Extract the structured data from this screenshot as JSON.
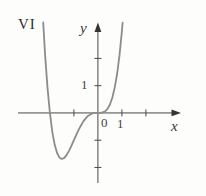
{
  "panel_label": "VI",
  "axes": {
    "x_axis_label": "x",
    "y_axis_label": "y",
    "origin_label": "0",
    "x_tick_label": "1",
    "y_tick_label": "1",
    "x_ticks": [
      -1,
      1,
      2
    ],
    "y_ticks": [
      -2,
      -1,
      1,
      2
    ],
    "x_range": [
      -3.33,
      3.42
    ],
    "y_range": [
      -2.57,
      3.3
    ]
  },
  "colors": {
    "background": "#fdfdfc",
    "axis": "#4a4a4a",
    "arrow": "#333333",
    "curve": "#8c8c8c",
    "text": "#3a3a3a"
  },
  "chart_data": {
    "type": "line",
    "title": "",
    "xlabel": "x",
    "ylabel": "y",
    "xlim": [
      -3.33,
      3.42
    ],
    "ylim": [
      -2.57,
      3.3
    ],
    "grid": false,
    "legend": null,
    "curve": {
      "description": "quartic-shaped curve, zero and flat tangent at origin",
      "equation_fit": "y = x^4 + 2x^3",
      "x_domain": [
        -2.28,
        1.03
      ],
      "x_intercepts": [
        -2,
        0
      ],
      "local_min": {
        "x": -1.5,
        "y": -1.69
      },
      "points": [
        [
          -2.28,
          3.32
        ],
        [
          -2.2,
          2.13
        ],
        [
          -2.1,
          0.93
        ],
        [
          -2.0,
          0.0
        ],
        [
          -1.9,
          -0.69
        ],
        [
          -1.8,
          -1.17
        ],
        [
          -1.7,
          -1.47
        ],
        [
          -1.6,
          -1.64
        ],
        [
          -1.5,
          -1.69
        ],
        [
          -1.4,
          -1.65
        ],
        [
          -1.3,
          -1.54
        ],
        [
          -1.2,
          -1.38
        ],
        [
          -1.1,
          -1.2
        ],
        [
          -1.0,
          -1.0
        ],
        [
          -0.9,
          -0.8
        ],
        [
          -0.8,
          -0.61
        ],
        [
          -0.7,
          -0.45
        ],
        [
          -0.6,
          -0.3
        ],
        [
          -0.5,
          -0.19
        ],
        [
          -0.4,
          -0.1
        ],
        [
          -0.3,
          -0.05
        ],
        [
          -0.2,
          -0.01
        ],
        [
          -0.1,
          0.0
        ],
        [
          0.0,
          0.0
        ],
        [
          0.1,
          0.0
        ],
        [
          0.2,
          0.02
        ],
        [
          0.3,
          0.06
        ],
        [
          0.4,
          0.15
        ],
        [
          0.5,
          0.31
        ],
        [
          0.6,
          0.56
        ],
        [
          0.7,
          0.93
        ],
        [
          0.8,
          1.43
        ],
        [
          0.9,
          2.11
        ],
        [
          1.0,
          3.0
        ],
        [
          1.03,
          3.31
        ]
      ]
    }
  }
}
